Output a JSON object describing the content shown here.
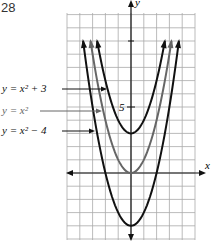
{
  "problem_number": "28",
  "axes": {
    "x_label": "x",
    "y_label": "y",
    "y_tick_label": "5"
  },
  "x_range": [
    -5,
    5
  ],
  "y_range": [
    -5,
    12
  ],
  "curves": [
    {
      "name": "y-equals-x-squared-plus-3",
      "label": "y = x² + 3",
      "shift": 3,
      "color": "#111111"
    },
    {
      "name": "y-equals-x-squared",
      "label": "y = x²",
      "shift": 0,
      "color": "#666666"
    },
    {
      "name": "y-equals-x-squared-minus-4",
      "label": "y = x² − 4",
      "shift": -4,
      "color": "#111111"
    }
  ]
}
